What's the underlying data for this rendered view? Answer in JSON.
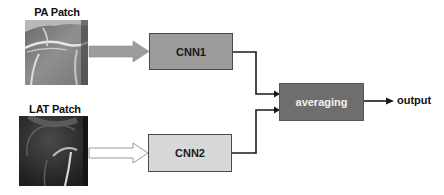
{
  "diagram": {
    "type": "flowchart",
    "inputs": [
      {
        "id": "pa",
        "label": "PA Patch",
        "image": "knee-xray-pa-icon"
      },
      {
        "id": "lat",
        "label": "LAT Patch",
        "image": "knee-xray-lat-icon"
      }
    ],
    "nodes": [
      {
        "id": "cnn1",
        "label": "CNN1",
        "fill": "#9c9c9c",
        "text_color": "#1a1a1a"
      },
      {
        "id": "cnn2",
        "label": "CNN2",
        "fill": "#d8d8d8",
        "text_color": "#1a1a1a"
      },
      {
        "id": "avg",
        "label": "averaging",
        "fill": "#6e6e6e",
        "text_color": "#f2f2f2"
      }
    ],
    "outputs": [
      {
        "id": "out",
        "label": "output"
      }
    ],
    "edges": [
      {
        "from": "pa",
        "to": "cnn1",
        "style": "thick-gray-arrow",
        "color": "#9c9c9c"
      },
      {
        "from": "lat",
        "to": "cnn2",
        "style": "hollow-arrow",
        "color": "#ffffff"
      },
      {
        "from": "cnn1",
        "to": "avg",
        "style": "elbow-black-arrow"
      },
      {
        "from": "cnn2",
        "to": "avg",
        "style": "elbow-black-arrow"
      },
      {
        "from": "avg",
        "to": "out",
        "style": "black-arrow"
      }
    ]
  }
}
